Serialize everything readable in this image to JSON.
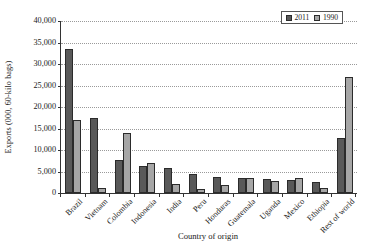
{
  "chart_data": {
    "type": "bar",
    "title": "",
    "xlabel": "Country of origin",
    "ylabel": "Exports (000, 60-kilo bags)",
    "ylim": [
      0,
      40000
    ],
    "ytick_labels": [
      "40,000",
      "35,000",
      "30,000",
      "25,000",
      "20,000",
      "15,000",
      "10,000",
      "5,000",
      "0"
    ],
    "ytick_values": [
      40000,
      35000,
      30000,
      25000,
      20000,
      15000,
      10000,
      5000,
      0
    ],
    "grid": "horizontal-dotted",
    "legend_position": "top-right",
    "categories": [
      "Brazil",
      "Vietnam",
      "Colombia",
      "Indonesia",
      "India",
      "Peru",
      "Honduras",
      "Guatemala",
      "Uganda",
      "Mexico",
      "Ethiopia",
      "Rest of world"
    ],
    "series": [
      {
        "name": "2011",
        "color": "#595959",
        "values": [
          33500,
          17500,
          7700,
          6200,
          5900,
          4400,
          3800,
          3600,
          3200,
          3100,
          2500,
          12800
        ]
      },
      {
        "name": "1990",
        "color": "#a6a6a6",
        "values": [
          17000,
          1200,
          14000,
          7000,
          2200,
          1000,
          1800,
          3400,
          2800,
          3500,
          1200,
          27000
        ]
      }
    ]
  },
  "legend": {
    "entries": [
      {
        "label": "2011"
      },
      {
        "label": "1990"
      }
    ]
  },
  "colors": {
    "series_2011": "#595959",
    "series_1990": "#a6a6a6",
    "axis": "#333333",
    "gridline": "#9a9a9a",
    "background": "#ffffff"
  }
}
